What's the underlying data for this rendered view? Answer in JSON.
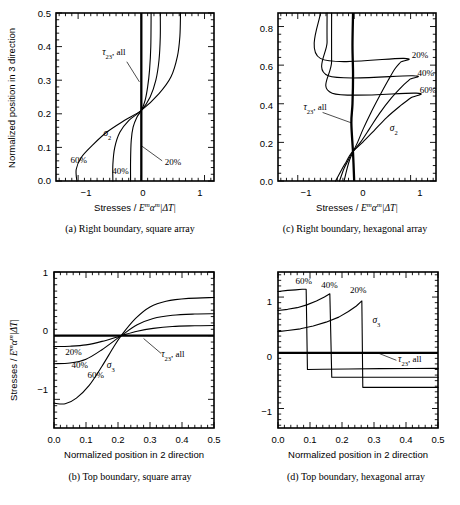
{
  "figure": {
    "title": "",
    "panels": [
      "a",
      "b",
      "c",
      "d"
    ]
  },
  "panel_a": {
    "caption": "(a) Right boundary, square array",
    "xlabel_parts": {
      "lead": "Stresses / ",
      "E": "E",
      "Esup": "m",
      "alpha": "α",
      "asup": "m",
      "dt": "|ΔT|"
    },
    "ylabel": "Normalized position in 3 direction",
    "xticks": [
      "−1",
      "0",
      "1"
    ],
    "yticks": [
      "0.0",
      "0.1",
      "0.2",
      "0.3",
      "0.4",
      "0.5"
    ],
    "annotations": {
      "tau": "τ",
      "tau_sub": "23",
      "tau_rest": ", all",
      "sigma": "σ",
      "sigma_sub": "2",
      "p20": "20%",
      "p40": "40%",
      "p60": "60%"
    }
  },
  "panel_b": {
    "caption": "(b) Top boundary, square array",
    "xlabel": "Normalized position in 2 direction",
    "ylabel_parts": {
      "lead": "Stresses / ",
      "E": "E",
      "Esup": "m",
      "alpha": "α",
      "asup": "m",
      "dt": "|ΔT|"
    },
    "xticks": [
      "0.0",
      "0.1",
      "0.2",
      "0.3",
      "0.4",
      "0.5"
    ],
    "yticks": [
      "1",
      "0",
      "−1"
    ],
    "annotations": {
      "tau": "τ",
      "tau_sub": "23",
      "tau_rest": ", all",
      "sigma": "σ",
      "sigma_sub": "3",
      "p20": "20%",
      "p40": "40%",
      "p60": "60%"
    }
  },
  "panel_c": {
    "caption": "(c) Right boundary, hexagonal array",
    "xlabel_parts": {
      "lead": "Stresses / ",
      "E": "E",
      "Esup": "m",
      "alpha": "α",
      "asup": "m",
      "dt": "|ΔT|"
    },
    "ylabel": "",
    "xticks": [
      "−1",
      "0",
      "1"
    ],
    "yticks": [
      "0.0",
      "0.2",
      "0.4",
      "0.6",
      "0.8"
    ],
    "annotations": {
      "tau": "τ",
      "tau_sub": "23",
      "tau_rest": ", all",
      "sigma": "σ",
      "sigma_sub": "2",
      "p20": "20%",
      "p40": "40%",
      "p60": "60%"
    }
  },
  "panel_d": {
    "caption": "(d) Top boundary, hexagonal array",
    "xlabel": "Normalized position in 2 direction",
    "ylabel": "",
    "xticks": [
      "0.0",
      "0.1",
      "0.2",
      "0.3",
      "0.4",
      "0.5"
    ],
    "yticks": [
      "1",
      "0",
      "−1"
    ],
    "annotations": {
      "tau": "τ",
      "tau_sub": "23",
      "tau_rest": ", all",
      "sigma": "σ",
      "sigma_sub": "3",
      "p20": "20%",
      "p40": "40%",
      "p60": "60%"
    }
  },
  "chart_data": [
    {
      "id": "a",
      "type": "line",
      "title": "(a) Right boundary, square array",
      "xlabel": "Stresses / E^m alpha^m |dT|",
      "ylabel": "Normalized position in 3 direction",
      "xlim": [
        -1.35,
        1.15
      ],
      "ylim": [
        0.0,
        0.5
      ],
      "orientation": "x-is-stress, y-is-position",
      "grid": false,
      "legend": "inline-annotations",
      "series": [
        {
          "name": "sigma_2, 20%",
          "label": "20%",
          "points": [
            [
              -0.17,
              0.0
            ],
            [
              -0.17,
              0.06
            ],
            [
              -0.16,
              0.12
            ],
            [
              -0.13,
              0.16
            ],
            [
              -0.07,
              0.19
            ],
            [
              0.0,
              0.21
            ],
            [
              0.06,
              0.24
            ],
            [
              0.1,
              0.28
            ],
            [
              0.13,
              0.33
            ],
            [
              0.15,
              0.4
            ],
            [
              0.155,
              0.5
            ]
          ]
        },
        {
          "name": "sigma_2, 40%",
          "label": "40%",
          "points": [
            [
              -0.45,
              0.0
            ],
            [
              -0.45,
              0.05
            ],
            [
              -0.42,
              0.1
            ],
            [
              -0.34,
              0.145
            ],
            [
              -0.2,
              0.18
            ],
            [
              0.0,
              0.21
            ],
            [
              0.14,
              0.25
            ],
            [
              0.23,
              0.3
            ],
            [
              0.28,
              0.36
            ],
            [
              0.3,
              0.43
            ],
            [
              0.3,
              0.5
            ]
          ]
        },
        {
          "name": "sigma_2, 60%",
          "label": "60%",
          "points": [
            [
              -1.02,
              0.0
            ],
            [
              -1.03,
              0.035
            ],
            [
              -0.95,
              0.07
            ],
            [
              -0.78,
              0.105
            ],
            [
              -0.55,
              0.145
            ],
            [
              -0.27,
              0.18
            ],
            [
              0.0,
              0.21
            ],
            [
              0.28,
              0.26
            ],
            [
              0.47,
              0.31
            ],
            [
              0.57,
              0.37
            ],
            [
              0.61,
              0.43
            ],
            [
              0.62,
              0.5
            ]
          ]
        },
        {
          "name": "tau_23, all",
          "label": "τ_23, all",
          "constant_value": 0.0,
          "points": [
            [
              0.0,
              0.0
            ],
            [
              0.0,
              0.5
            ]
          ]
        }
      ],
      "annotations": [
        {
          "text": "τ_23, all",
          "x": -0.62,
          "y": 0.375
        },
        {
          "text": "σ_2",
          "x": -0.6,
          "y": 0.135
        },
        {
          "text": "20%",
          "x": 0.37,
          "y": 0.048
        },
        {
          "text": "40%",
          "x": -0.46,
          "y": 0.022
        },
        {
          "text": "60%",
          "x": -1.12,
          "y": 0.055
        }
      ]
    },
    {
      "id": "b",
      "type": "line",
      "title": "(b) Top boundary, square array",
      "xlabel": "Normalized position in 2 direction",
      "ylabel": "Stresses / E^m alpha^m |dT|",
      "xlim": [
        0.0,
        0.5
      ],
      "ylim": [
        -1.45,
        1.0
      ],
      "grid": false,
      "legend": "inline-annotations",
      "series": [
        {
          "name": "sigma_3, 20%",
          "label": "20%",
          "points": [
            [
              0.0,
              -0.17
            ],
            [
              0.05,
              -0.165
            ],
            [
              0.1,
              -0.145
            ],
            [
              0.15,
              -0.09
            ],
            [
              0.21,
              0.0
            ],
            [
              0.26,
              0.07
            ],
            [
              0.31,
              0.115
            ],
            [
              0.37,
              0.145
            ],
            [
              0.44,
              0.155
            ],
            [
              0.5,
              0.16
            ]
          ]
        },
        {
          "name": "sigma_3, 40%",
          "label": "40%",
          "points": [
            [
              0.0,
              -0.44
            ],
            [
              0.05,
              -0.43
            ],
            [
              0.1,
              -0.37
            ],
            [
              0.15,
              -0.22
            ],
            [
              0.21,
              0.0
            ],
            [
              0.26,
              0.17
            ],
            [
              0.31,
              0.27
            ],
            [
              0.37,
              0.32
            ],
            [
              0.44,
              0.34
            ],
            [
              0.5,
              0.345
            ]
          ]
        },
        {
          "name": "sigma_3, 60%",
          "label": "60%",
          "points": [
            [
              0.0,
              -1.06
            ],
            [
              0.035,
              -1.07
            ],
            [
              0.07,
              -0.98
            ],
            [
              0.11,
              -0.78
            ],
            [
              0.15,
              -0.48
            ],
            [
              0.185,
              -0.19
            ],
            [
              0.21,
              0.0
            ],
            [
              0.255,
              0.27
            ],
            [
              0.3,
              0.45
            ],
            [
              0.35,
              0.54
            ],
            [
              0.42,
              0.585
            ],
            [
              0.5,
              0.6
            ]
          ]
        },
        {
          "name": "tau_23, all",
          "label": "τ_23, all",
          "constant_value": 0.0,
          "points": [
            [
              0.0,
              0.0
            ],
            [
              0.5,
              0.0
            ]
          ]
        }
      ],
      "annotations": [
        {
          "text": "20%",
          "x": 0.035,
          "y": -0.3
        },
        {
          "text": "40%",
          "x": 0.055,
          "y": -0.5
        },
        {
          "text": "60%",
          "x": 0.105,
          "y": -0.66
        },
        {
          "text": "σ_3",
          "x": 0.165,
          "y": -0.5
        },
        {
          "text": "τ_23, all",
          "x": 0.335,
          "y": -0.34
        }
      ]
    },
    {
      "id": "c",
      "type": "line",
      "title": "(c) Right boundary, hexagonal array",
      "xlabel": "Stresses / E^m alpha^m |dT|",
      "ylabel": "",
      "xlim": [
        -1.35,
        1.45
      ],
      "ylim": [
        0.0,
        0.87
      ],
      "grid": false,
      "legend": "inline-annotations",
      "series": [
        {
          "name": "sigma_2, 20%",
          "label": "20%",
          "points": [
            [
              -0.18,
              0.0
            ],
            [
              -0.12,
              0.07
            ],
            [
              -0.08,
              0.11
            ],
            [
              -0.03,
              0.145
            ],
            [
              0.06,
              0.2
            ],
            [
              0.16,
              0.27
            ],
            [
              0.29,
              0.35
            ],
            [
              0.45,
              0.44
            ],
            [
              0.6,
              0.52
            ],
            [
              0.72,
              0.58
            ],
            [
              0.82,
              0.615
            ],
            [
              0.88,
              0.635
            ],
            [
              -0.6,
              0.635
            ],
            [
              -0.6,
              0.87
            ]
          ]
        },
        {
          "name": "sigma_2, 40%",
          "label": "40%",
          "points": [
            [
              -0.26,
              0.0
            ],
            [
              -0.18,
              0.065
            ],
            [
              -0.11,
              0.105
            ],
            [
              -0.04,
              0.145
            ],
            [
              0.11,
              0.2
            ],
            [
              0.27,
              0.27
            ],
            [
              0.45,
              0.35
            ],
            [
              0.66,
              0.43
            ],
            [
              0.85,
              0.49
            ],
            [
              0.98,
              0.525
            ],
            [
              1.04,
              0.545
            ],
            [
              -0.46,
              0.545
            ],
            [
              -0.48,
              0.72
            ],
            [
              -0.48,
              0.87
            ]
          ]
        },
        {
          "name": "sigma_2, 60%",
          "label": "60%",
          "points": [
            [
              -0.33,
              0.0
            ],
            [
              -0.22,
              0.06
            ],
            [
              -0.14,
              0.1
            ],
            [
              -0.05,
              0.145
            ],
            [
              0.15,
              0.2
            ],
            [
              0.35,
              0.26
            ],
            [
              0.58,
              0.33
            ],
            [
              0.82,
              0.39
            ],
            [
              1.0,
              0.43
            ],
            [
              1.1,
              0.455
            ],
            [
              -0.39,
              0.455
            ],
            [
              -0.4,
              0.62
            ],
            [
              -0.4,
              0.87
            ]
          ]
        },
        {
          "name": "tau_23, all",
          "label": "τ_23, all",
          "constant_value": 0.0,
          "points": [
            [
              0.0,
              0.0
            ],
            [
              -0.02,
              0.145
            ],
            [
              -0.05,
              0.3
            ],
            [
              -0.03,
              0.4
            ],
            [
              -0.02,
              0.55
            ],
            [
              -0.03,
              0.7
            ],
            [
              -0.02,
              0.87
            ]
          ]
        }
      ],
      "annotations": [
        {
          "text": "20%",
          "x": 1.02,
          "y": 0.635
        },
        {
          "text": "40%",
          "x": 1.12,
          "y": 0.545
        },
        {
          "text": "60%",
          "x": 1.16,
          "y": 0.455
        },
        {
          "text": "τ_23, all",
          "x": -0.9,
          "y": 0.37
        },
        {
          "text": "σ_2",
          "x": 0.63,
          "y": 0.26
        }
      ]
    },
    {
      "id": "d",
      "type": "line",
      "title": "(d) Top boundary, hexagonal array",
      "xlabel": "Normalized position in 2 direction",
      "ylabel": "",
      "xlim": [
        0.0,
        0.5
      ],
      "ylim": [
        -1.35,
        1.45
      ],
      "grid": false,
      "legend": "inline-annotations",
      "series": [
        {
          "name": "sigma_3, 20%",
          "label": "20%",
          "points": [
            [
              0.0,
              0.38
            ],
            [
              0.03,
              0.4
            ],
            [
              0.07,
              0.43
            ],
            [
              0.11,
              0.48
            ],
            [
              0.15,
              0.55
            ],
            [
              0.19,
              0.64
            ],
            [
              0.22,
              0.74
            ],
            [
              0.245,
              0.84
            ],
            [
              0.262,
              0.93
            ],
            [
              0.265,
              -0.62
            ],
            [
              0.32,
              -0.62
            ],
            [
              0.4,
              -0.62
            ],
            [
              0.5,
              -0.62
            ]
          ]
        },
        {
          "name": "sigma_3, 40%",
          "label": "40%",
          "points": [
            [
              0.0,
              0.76
            ],
            [
              0.03,
              0.78
            ],
            [
              0.06,
              0.81
            ],
            [
              0.09,
              0.86
            ],
            [
              0.12,
              0.93
            ],
            [
              0.145,
              1.0
            ],
            [
              0.162,
              1.06
            ],
            [
              0.168,
              -0.44
            ],
            [
              0.22,
              -0.44
            ],
            [
              0.3,
              -0.44
            ],
            [
              0.4,
              -0.44
            ],
            [
              0.5,
              -0.44
            ]
          ]
        },
        {
          "name": "sigma_3, 60%",
          "label": "60%",
          "points": [
            [
              0.0,
              1.1
            ],
            [
              0.03,
              1.12
            ],
            [
              0.055,
              1.13
            ],
            [
              0.075,
              1.14
            ],
            [
              0.088,
              1.14
            ],
            [
              0.092,
              -0.3
            ],
            [
              0.14,
              -0.295
            ],
            [
              0.22,
              -0.29
            ],
            [
              0.32,
              -0.285
            ],
            [
              0.42,
              -0.282
            ],
            [
              0.5,
              -0.28
            ]
          ]
        },
        {
          "name": "tau_23, all",
          "label": "τ_23, all",
          "constant_value": 0.0,
          "points": [
            [
              0.0,
              0.0
            ],
            [
              0.5,
              0.0
            ]
          ]
        }
      ],
      "annotations": [
        {
          "text": "60%",
          "x": 0.055,
          "y": 1.24
        },
        {
          "text": "40%",
          "x": 0.135,
          "y": 1.17
        },
        {
          "text": "20%",
          "x": 0.225,
          "y": 1.08
        },
        {
          "text": "σ_3",
          "x": 0.295,
          "y": 0.53
        },
        {
          "text": "τ_23, all",
          "x": 0.375,
          "y": -0.17
        }
      ]
    }
  ]
}
